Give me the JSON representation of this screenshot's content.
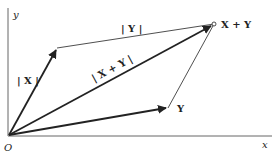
{
  "diagram": {
    "axes": {
      "x_label": "x",
      "y_label": "y",
      "origin_label": "O"
    },
    "points": {
      "origin": [
        9,
        135
      ],
      "X": [
        57,
        48
      ],
      "Y": [
        168,
        108
      ],
      "X_plus_Y": [
        214,
        24
      ]
    },
    "labels": {
      "X_vector": "X",
      "Y_vector": "Y",
      "X_plus_Y_point": "X + Y",
      "norm_X": "| X |",
      "norm_Y": "| Y |",
      "norm_X_plus_Y": "| X + Y |"
    },
    "colors": {
      "line": "#222222",
      "axis": "#555555"
    }
  }
}
